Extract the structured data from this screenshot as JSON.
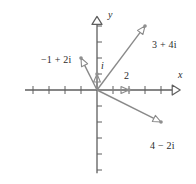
{
  "figure": {
    "title": "",
    "axes": {
      "x_label": "x",
      "y_label": "y",
      "x_label_pos": [
        178,
        70
      ],
      "y_label_pos": [
        108,
        10
      ],
      "origin": [
        97,
        90
      ],
      "unit": 16,
      "x_range": [
        -4.5,
        5.2
      ],
      "y_range": [
        -5.2,
        4.6
      ],
      "grid": false,
      "tick_len": 4
    },
    "colors": {
      "axis": "#5e5e5e",
      "vector": "#8a8a8a",
      "marker": "#8f8f8f",
      "text": "#2b2b2b",
      "background": "#ffffff"
    }
  },
  "chart_data": {
    "type": "scatter",
    "title": "",
    "xlabel": "x",
    "ylabel": "y",
    "xlim": [
      -4.5,
      5.2
    ],
    "ylim": [
      -5.2,
      4.6
    ],
    "grid": false,
    "legend": "none",
    "vectors": [
      {
        "label": "3 + 4i",
        "re": 3,
        "im": 4,
        "label_pos": [
          152,
          40
        ]
      },
      {
        "label": "−1 + 2i",
        "re": -1,
        "im": 2,
        "label_pos": [
          41,
          55
        ]
      },
      {
        "label": "4 − 2i",
        "re": 4,
        "im": -2,
        "label_pos": [
          150,
          141
        ]
      },
      {
        "label": "i",
        "re": 0,
        "im": 1,
        "label_pos": [
          101,
          61
        ]
      },
      {
        "label": "2",
        "re": 2,
        "im": 0,
        "label_pos": [
          124,
          71
        ]
      }
    ],
    "points": [
      {
        "x": 3,
        "y": 4
      },
      {
        "x": -1,
        "y": 2
      },
      {
        "x": 4,
        "y": -2
      },
      {
        "x": 0,
        "y": 1
      },
      {
        "x": 2,
        "y": 0
      }
    ],
    "x_ticks": [
      -4,
      -3,
      -2,
      -1,
      1,
      2,
      3,
      4
    ],
    "y_ticks": [
      -5,
      -4,
      -3,
      -2,
      -1,
      1,
      2,
      3,
      4
    ]
  }
}
